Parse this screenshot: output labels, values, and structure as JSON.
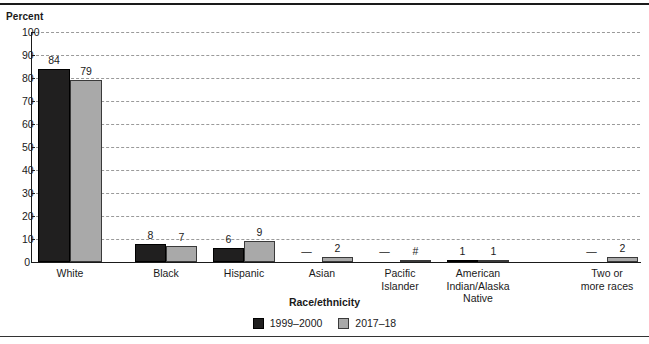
{
  "figure": {
    "y_axis_title": "Percent",
    "x_axis_title": "Race/ethnicity"
  },
  "legend": {
    "items": [
      {
        "label": "1999–2000",
        "color": "#201f1f",
        "swatch": "series-1-swatch"
      },
      {
        "label": "2017–18",
        "color": "#a9a9a9",
        "swatch": "series-2-swatch"
      }
    ]
  },
  "y_axis": {
    "ticks": [
      "0",
      "10",
      "20",
      "30",
      "40",
      "50",
      "60",
      "70",
      "80",
      "90",
      "100"
    ]
  },
  "categories": [
    {
      "label_lines": [
        "White"
      ]
    },
    {
      "label_lines": [
        "Black"
      ]
    },
    {
      "label_lines": [
        "Hispanic"
      ]
    },
    {
      "label_lines": [
        "Asian"
      ]
    },
    {
      "label_lines": [
        "Pacific",
        "Islander"
      ]
    },
    {
      "label_lines": [
        "American",
        "Indian/Alaska",
        "Native"
      ]
    },
    {
      "label_lines": [
        "Two or",
        "more races"
      ]
    }
  ],
  "bar_labels": {
    "series1": [
      "84",
      "8",
      "6",
      "—",
      "—",
      "1",
      "—"
    ],
    "series2": [
      "79",
      "7",
      "9",
      "2",
      "#",
      "1",
      "2"
    ]
  },
  "chart_data": {
    "type": "bar",
    "title": "",
    "subtitle": "",
    "xlabel": "Race/ethnicity",
    "ylabel": "Percent",
    "ylim": [
      0,
      100
    ],
    "ytick_interval": 10,
    "grid": true,
    "grid_style": "dashed-horizontal",
    "legend_position": "bottom-center",
    "categories": [
      "White",
      "Black",
      "Hispanic",
      "Asian",
      "Pacific Islander",
      "American Indian/Alaska Native",
      "Two or more races"
    ],
    "series": [
      {
        "name": "1999–2000",
        "color": "#201f1f",
        "values": [
          84,
          8,
          6,
          null,
          null,
          1,
          null
        ],
        "data_labels": [
          "84",
          "8",
          "6",
          "—",
          "—",
          "1",
          "—"
        ]
      },
      {
        "name": "2017–18",
        "color": "#a9a9a9",
        "values": [
          79,
          7,
          9,
          2,
          0,
          1,
          2
        ],
        "data_labels": [
          "79",
          "7",
          "9",
          "2",
          "#",
          "1",
          "2"
        ]
      }
    ]
  }
}
